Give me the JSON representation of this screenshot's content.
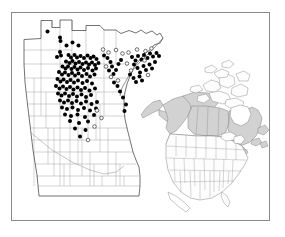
{
  "figure": {
    "kind": "species-distribution-map",
    "frame": {
      "x": 11,
      "y": 12,
      "width": 259,
      "height": 209,
      "border_color": "#8a8a8a",
      "background": "#ffffff"
    },
    "caption": "",
    "title": ""
  },
  "legend": {
    "items": [
      {
        "symbol": "filled-circle",
        "label": "",
        "color": "#000000",
        "meaning": "verified county record"
      },
      {
        "symbol": "open-circle",
        "label": "",
        "color": "#ffffff",
        "stroke": "#333333",
        "meaning": "unverified / historical record"
      }
    ]
  },
  "main_map": {
    "name": "minnesota-county-map",
    "region": "Minnesota",
    "county_line_color": "#9a9a9a",
    "state_outline_color": "#555555",
    "fill": "#ffffff",
    "outline": "M 24,64 L 24,39.5 L 41,38.5 L 41,20.5 L 52,20.5 L 52,27.5 L 60,27.5 L 60,20.0 L 72,20.0 L 72,30.5 L 86,30.5 L 86,25.5 L 100,25.5 L 104,30.0 L 116,30.0 L 121,33.5 L 129,30.5 L 136,33.0 L 141,30.0 L 146,33.5 L 152,31.0 L 157,35.0 L 160,33.0 L 163,38.0 L 160,43.0 L 154,45.0 L 150,50.0 L 145,53.0 L 141,58.5 L 137,63.0 L 133,69.0 L 130,76.0 L 127,84.0 L 125,92.0 L 124,100.0 L 124,110.0 L 125,119.0 L 127,128.0 L 129,136.0 L 131,144.0 L 133,152.0 L 136,160.0 L 139,167.0 L 140,176.0 L 140,186.0 L 139,196.0 L 39,196.0 L 37,175.0 L 33,150.0 L 30,125.0 L 27,100.0 L 25,82.0 L 24,64 Z"
  },
  "inset_map": {
    "name": "north-america-inset",
    "region": "North America",
    "shaded_color": "#d2d2d2",
    "unshaded_color": "#fdfdfd",
    "line_color": "#777777",
    "shaded_units": [
      "Alaska",
      "Yukon",
      "Northwest Territories",
      "Nunavut",
      "British Columbia",
      "Alberta",
      "Saskatchewan",
      "Manitoba",
      "Ontario",
      "Quebec",
      "Labrador",
      "Newfoundland",
      "New Brunswick",
      "Nova Scotia",
      "Prince Edward Island",
      "Washington",
      "Idaho",
      "Montana",
      "North Dakota",
      "South Dakota",
      "Wyoming",
      "Minnesota",
      "Wisconsin",
      "Michigan",
      "Iowa",
      "Illinois",
      "Indiana",
      "Ohio",
      "Pennsylvania",
      "New York",
      "Vermont",
      "New Hampshire",
      "Maine",
      "Massachusetts",
      "Connecticut",
      "Rhode Island",
      "New Jersey",
      "West Virginia",
      "Maryland",
      "Delaware"
    ]
  },
  "occurrence_points": {
    "filled": [
      [
        47.5,
        31.5
      ],
      [
        60.0,
        37.5
      ],
      [
        60.5,
        41.0
      ],
      [
        66.5,
        45.5
      ],
      [
        72.5,
        42.5
      ],
      [
        78.5,
        45.5
      ],
      [
        60.0,
        52.0
      ],
      [
        61.0,
        55.5
      ],
      [
        57.0,
        57.0
      ],
      [
        68.5,
        55.0
      ],
      [
        71.0,
        57.5
      ],
      [
        74.5,
        55.0
      ],
      [
        77.0,
        57.5
      ],
      [
        80.5,
        56.0
      ],
      [
        84.0,
        58.0
      ],
      [
        87.5,
        55.5
      ],
      [
        90.5,
        58.0
      ],
      [
        93.5,
        56.5
      ],
      [
        96.5,
        59.0
      ],
      [
        66.0,
        61.5
      ],
      [
        69.5,
        63.0
      ],
      [
        72.5,
        61.0
      ],
      [
        75.5,
        63.5
      ],
      [
        79.0,
        62.0
      ],
      [
        82.5,
        64.0
      ],
      [
        86.0,
        62.5
      ],
      [
        89.0,
        64.5
      ],
      [
        92.0,
        62.5
      ],
      [
        95.0,
        65.0
      ],
      [
        98.5,
        63.0
      ],
      [
        62.5,
        66.5
      ],
      [
        65.5,
        68.5
      ],
      [
        68.0,
        66.5
      ],
      [
        71.5,
        69.0
      ],
      [
        74.5,
        67.0
      ],
      [
        77.5,
        69.5
      ],
      [
        80.5,
        67.5
      ],
      [
        84.0,
        70.0
      ],
      [
        88.0,
        68.0
      ],
      [
        92.5,
        70.5
      ],
      [
        96.0,
        68.5
      ],
      [
        59.0,
        72.0
      ],
      [
        62.0,
        74.5
      ],
      [
        65.0,
        72.5
      ],
      [
        68.5,
        75.0
      ],
      [
        72.0,
        73.0
      ],
      [
        75.0,
        75.5
      ],
      [
        78.5,
        73.5
      ],
      [
        82.0,
        76.0
      ],
      [
        86.5,
        74.0
      ],
      [
        90.0,
        76.5
      ],
      [
        94.5,
        74.5
      ],
      [
        57.5,
        79.0
      ],
      [
        60.5,
        81.5
      ],
      [
        63.5,
        79.5
      ],
      [
        67.0,
        82.0
      ],
      [
        70.5,
        80.0
      ],
      [
        74.0,
        82.5
      ],
      [
        78.0,
        80.5
      ],
      [
        82.5,
        83.0
      ],
      [
        87.0,
        81.0
      ],
      [
        92.0,
        83.5
      ],
      [
        56.0,
        86.0
      ],
      [
        59.5,
        88.5
      ],
      [
        63.0,
        86.5
      ],
      [
        66.5,
        89.0
      ],
      [
        70.0,
        87.0
      ],
      [
        73.5,
        89.5
      ],
      [
        77.5,
        87.5
      ],
      [
        81.0,
        90.0
      ],
      [
        85.0,
        88.0
      ],
      [
        89.5,
        90.5
      ],
      [
        95.0,
        88.5
      ],
      [
        58.0,
        93.5
      ],
      [
        61.5,
        95.5
      ],
      [
        65.0,
        93.5
      ],
      [
        69.0,
        96.0
      ],
      [
        73.0,
        94.0
      ],
      [
        77.0,
        96.5
      ],
      [
        81.5,
        94.5
      ],
      [
        86.0,
        97.0
      ],
      [
        91.0,
        95.0
      ],
      [
        60.0,
        100.5
      ],
      [
        64.0,
        102.5
      ],
      [
        68.0,
        100.5
      ],
      [
        72.0,
        103.0
      ],
      [
        76.5,
        101.0
      ],
      [
        81.0,
        103.5
      ],
      [
        86.0,
        101.5
      ],
      [
        91.5,
        104.0
      ],
      [
        97.0,
        102.0
      ],
      [
        62.0,
        107.5
      ],
      [
        67.0,
        109.0
      ],
      [
        72.5,
        107.5
      ],
      [
        78.0,
        110.0
      ],
      [
        84.0,
        108.0
      ],
      [
        90.0,
        110.5
      ],
      [
        96.0,
        108.5
      ],
      [
        65.0,
        114.5
      ],
      [
        71.0,
        116.0
      ],
      [
        77.5,
        114.5
      ],
      [
        85.0,
        117.0
      ],
      [
        94.0,
        115.0
      ],
      [
        70.0,
        121.0
      ],
      [
        79.0,
        123.0
      ],
      [
        88.0,
        121.5
      ],
      [
        75.0,
        128.5
      ],
      [
        85.5,
        130.0
      ],
      [
        80.0,
        136.5
      ],
      [
        104.0,
        55.5
      ],
      [
        107.5,
        58.0
      ],
      [
        110.5,
        62.0
      ],
      [
        112.0,
        66.5
      ],
      [
        109.0,
        70.5
      ],
      [
        113.5,
        74.0
      ],
      [
        116.0,
        70.0
      ],
      [
        118.5,
        64.0
      ],
      [
        121.0,
        60.0
      ],
      [
        114.0,
        82.5
      ],
      [
        117.5,
        86.0
      ],
      [
        120.0,
        91.5
      ],
      [
        123.0,
        97.5
      ],
      [
        126.0,
        104.5
      ],
      [
        124.5,
        111.0
      ],
      [
        132.0,
        57.0
      ],
      [
        135.5,
        60.5
      ],
      [
        138.0,
        56.0
      ],
      [
        141.5,
        59.5
      ],
      [
        144.0,
        55.0
      ],
      [
        147.5,
        58.0
      ],
      [
        150.0,
        53.5
      ],
      [
        153.0,
        56.5
      ],
      [
        156.5,
        53.0
      ],
      [
        159.0,
        56.0
      ],
      [
        134.0,
        64.5
      ],
      [
        137.5,
        68.0
      ],
      [
        140.0,
        72.5
      ],
      [
        143.5,
        66.0
      ],
      [
        146.0,
        70.0
      ],
      [
        149.5,
        64.5
      ],
      [
        152.0,
        68.5
      ],
      [
        155.0,
        62.0
      ],
      [
        130.0,
        74.5
      ],
      [
        133.5,
        78.0
      ],
      [
        136.0,
        82.0
      ],
      [
        139.5,
        76.5
      ],
      [
        142.0,
        80.5
      ]
    ],
    "open": [
      [
        103.0,
        49.5
      ],
      [
        108.5,
        52.5
      ],
      [
        116.0,
        50.0
      ],
      [
        122.5,
        53.5
      ],
      [
        106.0,
        66.5
      ],
      [
        111.0,
        77.0
      ],
      [
        118.0,
        80.5
      ],
      [
        128.5,
        52.5
      ],
      [
        137.0,
        49.5
      ],
      [
        145.5,
        51.0
      ],
      [
        151.5,
        48.5
      ],
      [
        127.0,
        63.5
      ],
      [
        131.0,
        70.5
      ],
      [
        144.5,
        60.5
      ],
      [
        148.0,
        75.0
      ],
      [
        97.0,
        110.5
      ],
      [
        101.5,
        118.0
      ],
      [
        94.5,
        126.5
      ],
      [
        88.0,
        140.0
      ]
    ]
  },
  "symbols": {
    "filled_radius_px": 2.0,
    "open_radius_px": 1.8
  }
}
